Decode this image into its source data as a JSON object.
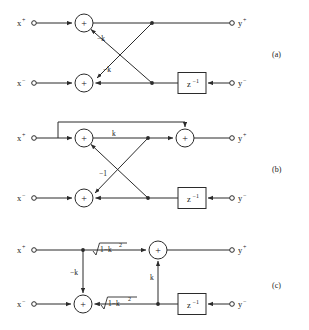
{
  "figure": {
    "panels": [
      {
        "id": "a",
        "panel_label": "(a)",
        "inputs": [
          {
            "name": "x-plus",
            "label": "x",
            "superscript": "+"
          },
          {
            "name": "x-minus",
            "label": "x",
            "superscript": "−"
          }
        ],
        "outputs": [
          {
            "name": "y-plus",
            "label": "y",
            "superscript": "+"
          },
          {
            "name": "y-minus",
            "label": "y",
            "superscript": "−"
          }
        ],
        "adders": [
          {
            "name": "adder-top",
            "symbol": "+"
          },
          {
            "name": "adder-bottom",
            "symbol": "+"
          }
        ],
        "delay_blocks": [
          {
            "name": "delay-bottom",
            "label": "z",
            "superscript": "−1"
          }
        ],
        "coefficients": [
          {
            "name": "coef-upper-cross",
            "label": "−k"
          },
          {
            "name": "coef-lower-cross",
            "label": "−k"
          }
        ]
      },
      {
        "id": "b",
        "panel_label": "(b)",
        "inputs": [
          {
            "name": "x-plus",
            "label": "x",
            "superscript": "+"
          },
          {
            "name": "x-minus",
            "label": "x",
            "superscript": "−"
          }
        ],
        "outputs": [
          {
            "name": "y-plus",
            "label": "y",
            "superscript": "+"
          },
          {
            "name": "y-minus",
            "label": "y",
            "superscript": "−"
          }
        ],
        "adders": [
          {
            "name": "adder-top-left",
            "symbol": "+"
          },
          {
            "name": "adder-top-right",
            "symbol": "+"
          },
          {
            "name": "adder-bottom",
            "symbol": "+"
          }
        ],
        "delay_blocks": [
          {
            "name": "delay-bottom",
            "label": "z",
            "superscript": "−1"
          }
        ],
        "coefficients": [
          {
            "name": "coef-forward",
            "label": "k"
          },
          {
            "name": "coef-feedback",
            "label": "−1"
          }
        ]
      },
      {
        "id": "c",
        "panel_label": "(c)",
        "inputs": [
          {
            "name": "x-plus",
            "label": "x",
            "superscript": "+"
          },
          {
            "name": "x-minus",
            "label": "x",
            "superscript": "−"
          }
        ],
        "outputs": [
          {
            "name": "y-plus",
            "label": "y",
            "superscript": "+"
          },
          {
            "name": "y-minus",
            "label": "y",
            "superscript": "−"
          }
        ],
        "adders": [
          {
            "name": "adder-top",
            "symbol": "+"
          },
          {
            "name": "adder-bottom",
            "symbol": "+"
          }
        ],
        "delay_blocks": [
          {
            "name": "delay-bottom",
            "label": "z",
            "superscript": "−1"
          }
        ],
        "coefficients": [
          {
            "name": "coef-top-sqrt",
            "radicand": "1−k",
            "radicand_exp": "2"
          },
          {
            "name": "coef-bottom-sqrt",
            "radicand": "1−k",
            "radicand_exp": "2"
          },
          {
            "name": "coef-down-branch",
            "label": "−k"
          },
          {
            "name": "coef-up-branch",
            "label": "k"
          }
        ]
      }
    ],
    "colors": {
      "background": "#ffffff",
      "ink": "#2b2b2b",
      "text": "#1a1a1a"
    }
  }
}
